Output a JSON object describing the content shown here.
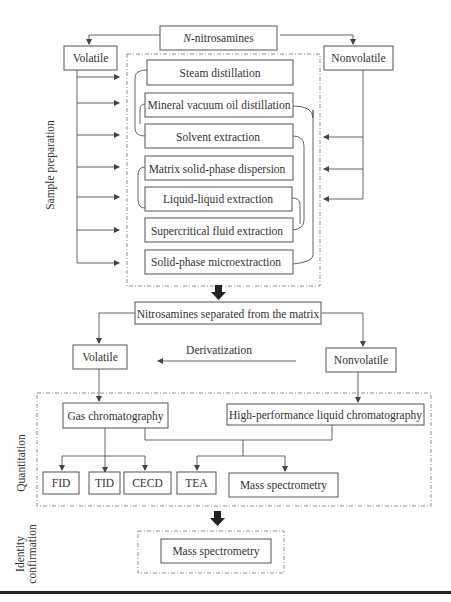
{
  "diagram": {
    "root": {
      "prefix": "N",
      "suffix": "-nitrosamines"
    },
    "top_branches": {
      "left": "Volatile",
      "right": "Nonvolatile"
    },
    "side_labels": {
      "sample_preparation": "Sample preparation",
      "quantitation": "Quantitation",
      "identity_line1": "Identity",
      "identity_line2": "confirmation"
    },
    "sample_preparation_methods": [
      "Steam distillation",
      "Mineral vacuum oil distillation",
      "Solvent extraction",
      "Matrix solid-phase dispersion",
      "Liquid-liquid extraction",
      "Supercritical fluid extraction",
      "Solid-phase microextraction"
    ],
    "separated": "Nitrosamines separated from the matrix",
    "mid_branches": {
      "left": "Volatile",
      "right": "Nonvolatile"
    },
    "derivatization": "Derivatization",
    "quantitation": {
      "gc": "Gas chromatography",
      "hplc": "High-performance liquid chromatography",
      "detectors": [
        "FID",
        "TID",
        "CECD",
        "TEA",
        "Mass spectrometry"
      ]
    },
    "identity": {
      "method": "Mass spectrometry"
    }
  }
}
